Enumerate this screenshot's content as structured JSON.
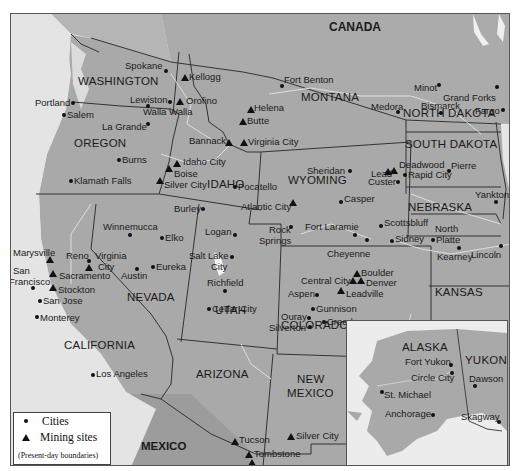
{
  "map": {
    "title_region": "Western United States mining and city map",
    "colors": {
      "land": "#a9a9a9",
      "land_dark": "#9b9b9b",
      "water": "#e6e6e6",
      "border": "#333333",
      "river": "#d8d8d8",
      "inset_bg": "#ececec"
    },
    "countries": {
      "canada": "CANADA",
      "mexico": "MEXICO"
    },
    "states": {
      "washington": "WASHINGTON",
      "oregon": "OREGON",
      "idaho": "IDAHO",
      "montana": "MONTANA",
      "wyoming": "WYOMING",
      "north_dakota": "NORTH DAKOTA",
      "south_dakota": "SOUTH DAKOTA",
      "nebraska": "NEBRASKA",
      "kansas": "KANSAS",
      "colorado": "COLORADO",
      "utah": "UTAH",
      "nevada": "NEVADA",
      "california": "CALIFORNIA",
      "arizona": "ARIZONA",
      "new_mexico_1": "NEW",
      "new_mexico_2": "MEXICO"
    },
    "cities": {
      "spokane": "Spokane",
      "portland": "Portland",
      "salem": "Salem",
      "lewiston": "Lewiston",
      "walla_walla": "Walla Walla",
      "la_grande": "La Grande",
      "burns": "Burns",
      "klamath_falls": "Klamath Falls",
      "burley": "Burley",
      "pocatello": "Pocatello",
      "fort_benton": "Fort Benton",
      "sheridan": "Sheridan",
      "casper": "Casper",
      "rock_springs_1": "Rock",
      "rock_springs_2": "Springs",
      "fort_laramie": "Fort Laramie",
      "cheyenne": "Cheyenne",
      "minot": "Minot",
      "grand_forks": "Grand Forks",
      "medora": "Medora",
      "bismarck": "Bismarck",
      "fargo": "Fargo",
      "pierre": "Pierre",
      "rapid_city": "Rapid City",
      "custer": "Custer",
      "yankton": "Yankton",
      "scottsbluff": "Scottsbluff",
      "sidney": "Sidney",
      "north_platte_1": "North",
      "north_platte_2": "Platte",
      "kearney": "Kearney",
      "lincoln": "Lincoln",
      "winnemucca": "Winnemucca",
      "elko": "Elko",
      "reno": "Reno",
      "austin": "Austin",
      "eureka": "Eureka",
      "logan": "Logan",
      "salt_lake_1": "Salt Lake",
      "salt_lake_2": "City",
      "richfield": "Richfield",
      "cedar_city": "Cedar City",
      "aspen": "Aspen",
      "gunnison": "Gunnison",
      "ouray": "Ouray",
      "silverton": "Silverton",
      "creede": "Creede",
      "san_francisco_1": "San",
      "san_francisco_2": "Francisco",
      "san_jose": "San Jose",
      "monterey": "Monterey",
      "los_angeles": "Los Angeles"
    },
    "mining_sites": {
      "kellogg": "Kellogg",
      "orofino": "Orofino",
      "helena": "Helena",
      "butte": "Butte",
      "bannack": "Bannack",
      "virginia_city_mt": "Virginia City",
      "idaho_city": "Idaho City",
      "boise": "Boise",
      "silver_city_id": "Silver City",
      "atlantic_city": "Atlantic City",
      "lead": "Lead",
      "deadwood": "Deadwood",
      "virginia_city_nv_1": "Virginia",
      "virginia_city_nv_2": "City",
      "marysville": "Marysville",
      "sacramento": "Sacramento",
      "stockton": "Stockton",
      "boulder": "Boulder",
      "central_city": "Central City",
      "denver": "Denver",
      "leadville": "Leadville",
      "tucson": "Tucson",
      "tombstone": "Tombstone",
      "bisbee": "Bisbee",
      "silver_city_nm": "Silver City"
    },
    "inset": {
      "alaska": "ALASKA",
      "yukon": "YUKON",
      "fort_yukon": "Fort Yukon",
      "circle_city": "Circle City",
      "dawson": "Dawson",
      "st_michael": "St. Michael",
      "anchorage": "Anchorage",
      "skagway": "Skagway"
    },
    "legend": {
      "cities": "Cities",
      "mining_sites": "Mining sites",
      "note": "(Present-day boundaries)"
    }
  }
}
